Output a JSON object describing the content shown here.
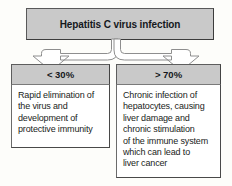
{
  "diagram": {
    "type": "flowchart",
    "root": {
      "label": "Hepatitis C virus infection"
    },
    "branches": [
      {
        "id": "acute-clearance",
        "header": "< 30%",
        "body": "Rapid elimination of\nthe virus and\ndevelopment of\nprotective immunity"
      },
      {
        "id": "chronic-infection",
        "header": "> 70%",
        "body": "Chronic infection of\nhepatocytes, causing\nliver damage and\nchronic stimulation\nof the immune system\nwhich can lead to\nliver cancer"
      }
    ],
    "colors": {
      "header_fill": "#c9c9c9",
      "body_fill": "#ffffff",
      "border": "#595959",
      "arrow_fill": "#ffffff",
      "arrow_stroke": "#8a8a8a",
      "text": "#15181c",
      "background": "#fdfdfa"
    }
  }
}
